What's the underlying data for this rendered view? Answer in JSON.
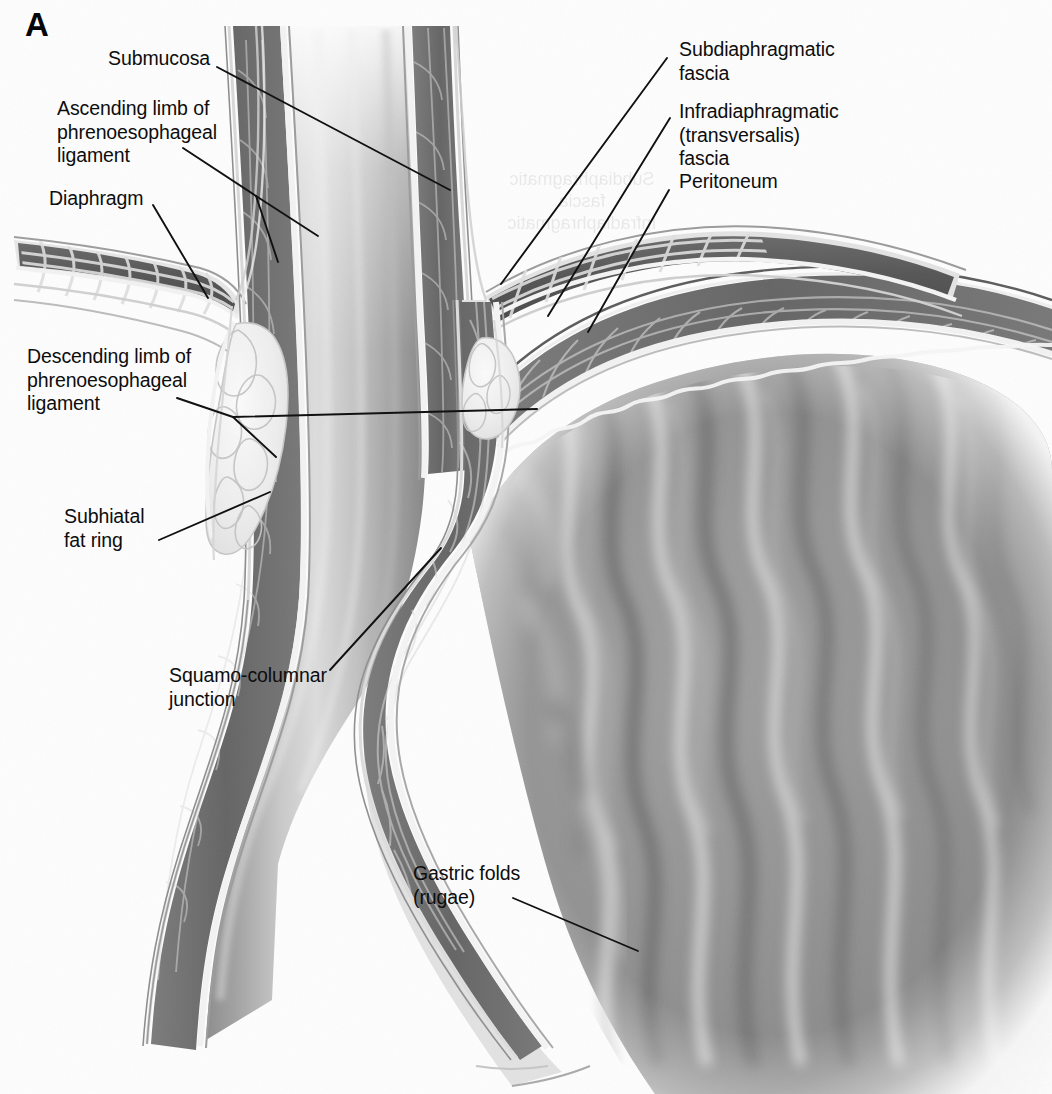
{
  "figure": {
    "panel_letter": "A",
    "background_color": "#fdfdfd",
    "line_color": "#111111",
    "text_color": "#0d0d0d",
    "width": 1052,
    "height": 1094
  },
  "labels": [
    {
      "id": "submucosa",
      "text": "Submucosa",
      "side": "left",
      "x": 108,
      "y": 47,
      "leader": [
        [
          217,
          67
        ],
        [
          450,
          190
        ]
      ]
    },
    {
      "id": "ascending-limb",
      "text": "Ascending limb of\nphrenoesophageal\nligament",
      "side": "left",
      "x": 57,
      "y": 97,
      "leader": [
        [
          183,
          148
        ],
        [
          256,
          196
        ]
      ],
      "leader2": [
        [
          256,
          196
        ],
        [
          305,
          228
        ]
      ],
      "leader3": [
        [
          256,
          196
        ],
        [
          279,
          253
        ]
      ]
    },
    {
      "id": "diaphragm",
      "text": "Diaphragm",
      "side": "left",
      "x": 49,
      "y": 187,
      "leader": [
        [
          153,
          205
        ],
        [
          208,
          297
        ]
      ]
    },
    {
      "id": "descending-limb",
      "text": "Descending limb of\nphrenoesophageal\nligament",
      "side": "left",
      "x": 27,
      "y": 345,
      "leader": [
        [
          177,
          398
        ],
        [
          233,
          417
        ]
      ],
      "leader2": [
        [
          233,
          417
        ],
        [
          520,
          410
        ]
      ],
      "leader3": [
        [
          233,
          417
        ],
        [
          274,
          455
        ]
      ]
    },
    {
      "id": "subhiatal-fat-ring",
      "text": "Subhiatal\nfat ring",
      "side": "left",
      "x": 64,
      "y": 505,
      "leader": [
        [
          160,
          539
        ],
        [
          272,
          492
        ]
      ]
    },
    {
      "id": "squamo-columnar-junction",
      "text": "Squamo-columnar\njunction",
      "side": "left",
      "x": 169,
      "y": 664,
      "leader": [
        [
          330,
          670
        ],
        [
          440,
          549
        ]
      ]
    },
    {
      "id": "gastric-folds",
      "text": "Gastric folds\n(rugae)",
      "side": "left",
      "x": 413,
      "y": 862,
      "leader": [
        [
          515,
          898
        ],
        [
          636,
          950
        ]
      ]
    },
    {
      "id": "subdiaphragmatic-fascia",
      "text": "Subdiaphragmatic\nfascia",
      "side": "right",
      "x": 679,
      "y": 38,
      "leader": [
        [
          667,
          57
        ],
        [
          501,
          283
        ]
      ]
    },
    {
      "id": "infradiaphragmatic-fascia",
      "text": "Infradiaphragmatic\n(transversalis)\nfascia",
      "side": "right",
      "x": 679,
      "y": 100,
      "leader": [
        [
          670,
          117
        ],
        [
          546,
          314
        ]
      ]
    },
    {
      "id": "peritoneum",
      "text": "Peritoneum",
      "side": "right",
      "x": 679,
      "y": 170,
      "leader": [
        [
          669,
          189
        ],
        [
          587,
          330
        ]
      ]
    }
  ],
  "showthrough": [
    {
      "text": "Subdiaphragmatic\nfascia\nInfradiaphragmatic",
      "x": 560,
      "y": 172
    }
  ],
  "anatomy": {
    "structures": [
      "esophagus",
      "esophageal-mucosa",
      "esophageal-submucosa",
      "esophageal-muscularis",
      "diaphragm-left-crus",
      "diaphragm-right-crus",
      "phrenoesophageal-ligament",
      "subhiatal-fat-ring",
      "peritoneum",
      "subdiaphragmatic-fascia",
      "stomach-fundus",
      "stomach-body",
      "gastric-rugae",
      "squamo-columnar-junction"
    ],
    "palette": {
      "muscle_dark": "#4c4c4c",
      "muscle_mid": "#6e6e6e",
      "fascia_light": "#d8d8d8",
      "lumen_light": "#f6f6f6",
      "fat_light": "#ececec",
      "mucosa_mid": "#8e8e8e",
      "serosa_line": "#e9e9e9"
    }
  }
}
